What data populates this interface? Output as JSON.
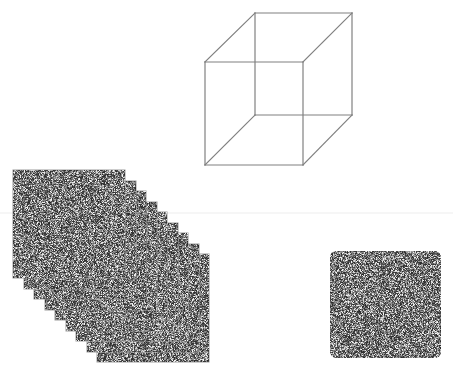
{
  "figure": {
    "background_color": "#ffffff",
    "width": 453,
    "height": 376
  },
  "cube": {
    "name": "necker-cube",
    "label": "Necker cube wireframe",
    "stroke_color": "#808080",
    "stroke_width": 1.2,
    "front_face": {
      "label": "front-face",
      "x": 205,
      "y": 62,
      "width": 98,
      "height": 103
    },
    "back_face": {
      "label": "back-face",
      "x": 255,
      "y": 13,
      "width": 97,
      "height": 102
    },
    "connector_edges": 4,
    "vertices": [
      {
        "name": "front-top-left",
        "x": 205,
        "y": 62
      },
      {
        "name": "front-top-right",
        "x": 303,
        "y": 62
      },
      {
        "name": "front-bottom-right",
        "x": 303,
        "y": 165
      },
      {
        "name": "front-bottom-left",
        "x": 205,
        "y": 165
      },
      {
        "name": "back-top-left",
        "x": 255,
        "y": 13
      },
      {
        "name": "back-top-right",
        "x": 352,
        "y": 13
      },
      {
        "name": "back-bottom-right",
        "x": 352,
        "y": 115
      },
      {
        "name": "back-bottom-left",
        "x": 255,
        "y": 115
      }
    ]
  },
  "divider": {
    "name": "horizontal-divider",
    "label": "faint horizontal rule",
    "y": 213,
    "x_start": 0,
    "x_end": 453,
    "color": "#ededed",
    "thickness": 1
  },
  "patch_stack": {
    "name": "noise-patch-stack",
    "label": "Stack of noise patches",
    "count": 9,
    "patch_width": 112,
    "patch_height": 108,
    "origin_x": 13,
    "origin_y": 170,
    "offset_x": 10.5,
    "offset_y": 10.5,
    "noise_mean_gray": "#8a8a8a",
    "noise_type": "white-noise",
    "border_color": "#9a9a9a"
  },
  "single_patch": {
    "name": "single-noise-patch",
    "label": "Single noise patch",
    "x": 330,
    "y": 251,
    "width": 111,
    "height": 107,
    "noise_mean_gray": "#8a8a8a",
    "noise_type": "white-noise",
    "corner_radius": 6,
    "border_color": "#9a9a9a"
  }
}
